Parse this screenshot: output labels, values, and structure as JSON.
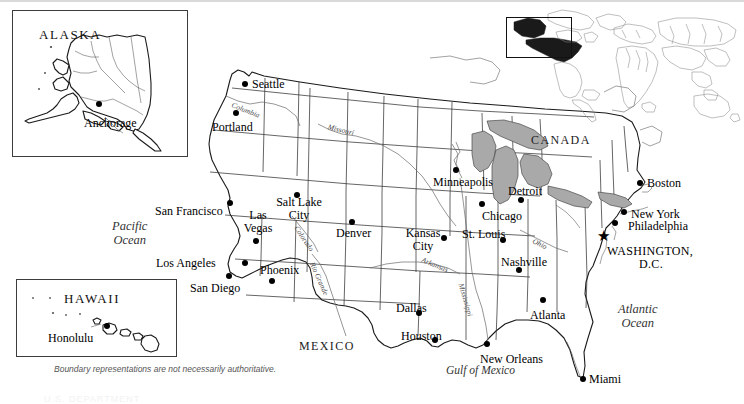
{
  "page": {
    "disclaimer": "Boundary representations are not necessarily authoritative.",
    "footer_fragment": "U.S. DEPARTMENT"
  },
  "insets": {
    "alaska": {
      "title": "ALASKA",
      "cities": [
        {
          "name": "Anchorage",
          "x": 99,
          "y": 104,
          "label_x": 84,
          "label_y": 117
        }
      ]
    },
    "hawaii": {
      "title": "HAWAII",
      "cities": [
        {
          "name": "Honolulu",
          "x": 107,
          "y": 326,
          "label_x": 48,
          "label_y": 332
        }
      ]
    },
    "locator": {
      "name": "world-locator-map",
      "highlight_region": "United States",
      "highlight_color": "#1a1a1a"
    }
  },
  "map": {
    "region_labels": [
      {
        "name": "CANADA",
        "x": 531,
        "y": 139
      },
      {
        "name": "MEXICO",
        "x": 299,
        "y": 344
      }
    ],
    "ocean_labels": [
      {
        "name": "Pacific\nOcean",
        "line1": "Pacific",
        "line2": "Ocean",
        "x": 114,
        "y": 225
      },
      {
        "name": "Atlantic\nOcean",
        "line1": "Atlantic",
        "line2": "Ocean",
        "x": 625,
        "y": 309
      }
    ],
    "water_labels": [
      {
        "name": "Gulf of Mexico",
        "x": 450,
        "y": 370
      }
    ],
    "river_labels": [
      {
        "name": "Columbia",
        "x": 236,
        "y": 103,
        "rotate": 22
      },
      {
        "name": "Missouri",
        "x": 331,
        "y": 125,
        "rotate": 14
      },
      {
        "name": "Colorado",
        "x": 299,
        "y": 226,
        "rotate": 56
      },
      {
        "name": "Rio Grande",
        "x": 315,
        "y": 262,
        "rotate": 66
      },
      {
        "name": "Arkansas",
        "x": 425,
        "y": 258,
        "rotate": 22
      },
      {
        "name": "Mississippi",
        "x": 463,
        "y": 283,
        "rotate": 74
      },
      {
        "name": "Ohio",
        "x": 536,
        "y": 239,
        "rotate": 26
      }
    ],
    "cities": [
      {
        "name": "Seattle",
        "marker": "dot",
        "x": 245,
        "y": 84,
        "label_x": 252,
        "label_y": 79,
        "align": "left"
      },
      {
        "name": "Portland",
        "marker": "dot",
        "x": 236,
        "y": 113,
        "label_x": 213,
        "label_y": 122,
        "align": "left"
      },
      {
        "name": "San Francisco",
        "marker": "dot",
        "x": 230,
        "y": 203,
        "label_x": 155,
        "label_y": 206,
        "align": "left"
      },
      {
        "name": "Los Angeles",
        "marker": "dot",
        "x": 245,
        "y": 263,
        "label_x": 156,
        "label_y": 258,
        "align": "left"
      },
      {
        "name": "San Diego",
        "marker": "dot",
        "x": 229,
        "y": 276,
        "label_x": 190,
        "label_y": 282,
        "align": "left"
      },
      {
        "name": "Las Vegas",
        "marker": "dot",
        "x": 256,
        "y": 241,
        "label_x": 241,
        "label_y": 211,
        "align": "center",
        "two_line": true,
        "line1": "Las",
        "line2": "Vegas"
      },
      {
        "name": "Phoenix",
        "marker": "dot",
        "x": 272,
        "y": 281,
        "label_x": 262,
        "label_y": 265,
        "align": "left"
      },
      {
        "name": "Salt Lake City",
        "marker": "dot",
        "x": 297,
        "y": 195,
        "label_x": 273,
        "label_y": 199,
        "align": "center",
        "two_line": true,
        "line1": "Salt Lake",
        "line2": "City"
      },
      {
        "name": "Denver",
        "marker": "dot",
        "x": 352,
        "y": 222,
        "label_x": 340,
        "label_y": 227,
        "align": "left"
      },
      {
        "name": "Minneapolis",
        "marker": "dot",
        "x": 456,
        "y": 170,
        "label_x": 436,
        "label_y": 176,
        "align": "left"
      },
      {
        "name": "Kansas City",
        "marker": "dot",
        "x": 444,
        "y": 238,
        "label_x": 404,
        "label_y": 229,
        "align": "center",
        "two_line": true,
        "line1": "Kansas",
        "line2": "City"
      },
      {
        "name": "St. Louis",
        "marker": "dot",
        "x": 503,
        "y": 240,
        "label_x": 464,
        "label_y": 230,
        "align": "left"
      },
      {
        "name": "Chicago",
        "marker": "dot",
        "x": 482,
        "y": 204,
        "label_x": 484,
        "label_y": 212,
        "align": "left"
      },
      {
        "name": "Detroit",
        "marker": "dot",
        "x": 521,
        "y": 200,
        "label_x": 510,
        "label_y": 186,
        "align": "left"
      },
      {
        "name": "Nashville",
        "marker": "dot",
        "x": 519,
        "y": 270,
        "label_x": 503,
        "label_y": 258,
        "align": "left"
      },
      {
        "name": "Atlanta",
        "marker": "dot",
        "x": 543,
        "y": 300,
        "label_x": 532,
        "label_y": 310,
        "align": "left"
      },
      {
        "name": "Dallas",
        "marker": "dot",
        "x": 419,
        "y": 313,
        "label_x": 398,
        "label_y": 303,
        "align": "left"
      },
      {
        "name": "Houston",
        "marker": "dot",
        "x": 435,
        "y": 340,
        "label_x": 403,
        "label_y": 331,
        "align": "left"
      },
      {
        "name": "New Orleans",
        "marker": "dot",
        "x": 487,
        "y": 344,
        "label_x": 482,
        "label_y": 354,
        "align": "left"
      },
      {
        "name": "Miami",
        "marker": "dot",
        "x": 583,
        "y": 379,
        "label_x": 589,
        "label_y": 374,
        "align": "left"
      },
      {
        "name": "Boston",
        "marker": "dot",
        "x": 640,
        "y": 183,
        "label_x": 647,
        "label_y": 178,
        "align": "left"
      },
      {
        "name": "New York",
        "marker": "dot",
        "x": 624,
        "y": 212,
        "label_x": 632,
        "label_y": 209,
        "align": "left"
      },
      {
        "name": "Philadelphia",
        "marker": "dot",
        "x": 615,
        "y": 223,
        "label_x": 629,
        "label_y": 221,
        "align": "left"
      },
      {
        "name": "WASHINGTON, D.C.",
        "marker": "star",
        "x": 604,
        "y": 244,
        "label_x": 607,
        "label_y": 245,
        "align": "left",
        "two_line": true,
        "line1": "WASHINGTON,",
        "line2": "D.C.",
        "caps": true
      }
    ]
  },
  "colors": {
    "land_fill": "#ffffff",
    "outline": "#1a1a1a",
    "lake_fill": "#a9a9a9",
    "marker": "#000000",
    "background": "#ffffff"
  }
}
